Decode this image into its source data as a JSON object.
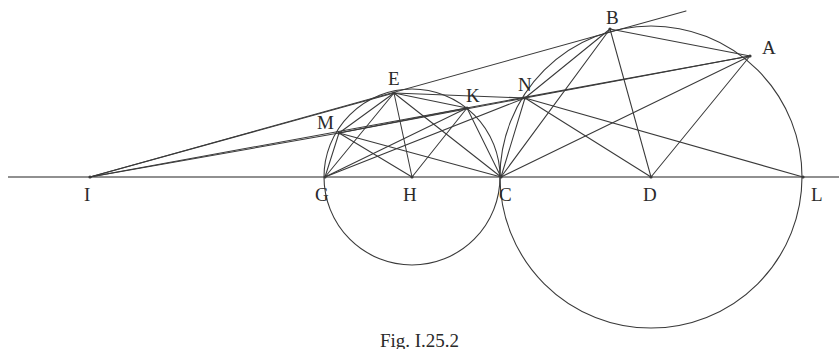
{
  "figure": {
    "caption": "Fig. I.25.2",
    "background_color": "#ffffff",
    "stroke_color": "#3a3a3a",
    "baseline_color": "#6b6b6b",
    "label_color": "#2a2a2a",
    "width": 839,
    "height": 349
  },
  "points": [
    {
      "name": "I",
      "x": 90,
      "y": 177,
      "label": "I",
      "label_dx": -6,
      "label_dy": 8
    },
    {
      "name": "G",
      "x": 325,
      "y": 177,
      "label": "G",
      "label_dx": -10,
      "label_dy": 8
    },
    {
      "name": "H",
      "x": 412,
      "y": 177,
      "label": "H",
      "label_dx": -9,
      "label_dy": 8
    },
    {
      "name": "C",
      "x": 501,
      "y": 177,
      "label": "C",
      "label_dx": -2,
      "label_dy": 8
    },
    {
      "name": "D",
      "x": 651,
      "y": 177,
      "label": "D",
      "label_dx": -8,
      "label_dy": 8
    },
    {
      "name": "L",
      "x": 803,
      "y": 177,
      "label": "L",
      "label_dx": 8,
      "label_dy": 8
    },
    {
      "name": "M",
      "x": 339,
      "y": 133,
      "label": "M",
      "label_dx": -22,
      "label_dy": -20
    },
    {
      "name": "E",
      "x": 394,
      "y": 93,
      "label": "E",
      "label_dx": -6,
      "label_dy": -24
    },
    {
      "name": "K",
      "x": 467,
      "y": 108,
      "label": "K",
      "label_dx": -1,
      "label_dy": -22
    },
    {
      "name": "N",
      "x": 525,
      "y": 98,
      "label": "N",
      "label_dx": -7,
      "label_dy": -23
    },
    {
      "name": "B",
      "x": 610,
      "y": 29,
      "label": "B",
      "label_dx": -4,
      "label_dy": -21
    },
    {
      "name": "A",
      "x": 750,
      "y": 56,
      "label": "A",
      "label_dx": 12,
      "label_dy": -18
    }
  ],
  "circles": [
    {
      "name": "small-circle",
      "cx": 412,
      "cy": 177,
      "r": 88,
      "through": [
        "G",
        "C"
      ]
    },
    {
      "name": "large-circle",
      "cx": 651,
      "cy": 177,
      "r": 151,
      "through": [
        "C",
        "L"
      ]
    }
  ],
  "baseline": {
    "name": "baseline-ILC",
    "x1": 8,
    "y1": 177,
    "x2": 839,
    "y2": 177
  },
  "segments": [
    {
      "name": "segment-I-B-tangent",
      "from": "I",
      "to": "B",
      "extend_to": {
        "x": 686,
        "y": 11
      }
    },
    {
      "name": "segment-I-A",
      "from": "I",
      "to": "A"
    },
    {
      "name": "segment-I-E",
      "from": "I",
      "to": "E"
    },
    {
      "name": "segment-I-M",
      "from": "I",
      "to": "M"
    },
    {
      "name": "segment-M-N",
      "from": "M",
      "to": "N"
    },
    {
      "name": "segment-M-K",
      "from": "M",
      "to": "K"
    },
    {
      "name": "segment-M-E",
      "from": "M",
      "to": "E"
    },
    {
      "name": "segment-M-H",
      "from": "M",
      "to": "H"
    },
    {
      "name": "segment-M-C",
      "from": "M",
      "to": "C"
    },
    {
      "name": "segment-G-E",
      "from": "G",
      "to": "E"
    },
    {
      "name": "segment-G-K",
      "from": "G",
      "to": "K"
    },
    {
      "name": "segment-G-N",
      "from": "G",
      "to": "N"
    },
    {
      "name": "segment-G-M",
      "from": "G",
      "to": "M"
    },
    {
      "name": "segment-E-H",
      "from": "E",
      "to": "H"
    },
    {
      "name": "segment-E-C",
      "from": "E",
      "to": "C"
    },
    {
      "name": "segment-E-K",
      "from": "E",
      "to": "K"
    },
    {
      "name": "segment-E-N",
      "from": "E",
      "to": "N"
    },
    {
      "name": "segment-K-H",
      "from": "K",
      "to": "H"
    },
    {
      "name": "segment-K-C",
      "from": "K",
      "to": "C"
    },
    {
      "name": "segment-N-C",
      "from": "N",
      "to": "C"
    },
    {
      "name": "segment-N-D",
      "from": "N",
      "to": "D"
    },
    {
      "name": "segment-N-A",
      "from": "N",
      "to": "A"
    },
    {
      "name": "segment-N-L",
      "from": "N",
      "to": "L"
    },
    {
      "name": "segment-N-B",
      "from": "N",
      "to": "B"
    },
    {
      "name": "segment-B-C",
      "from": "B",
      "to": "C"
    },
    {
      "name": "segment-B-D",
      "from": "B",
      "to": "D"
    },
    {
      "name": "segment-B-A",
      "from": "B",
      "to": "A"
    },
    {
      "name": "segment-A-C",
      "from": "A",
      "to": "C"
    },
    {
      "name": "segment-A-D",
      "from": "A",
      "to": "D"
    }
  ],
  "chart_data": {
    "type": "diagram",
    "title": "Fig. I.25.2",
    "labels": [
      "I",
      "G",
      "H",
      "C",
      "D",
      "L",
      "M",
      "E",
      "K",
      "N",
      "B",
      "A"
    ]
  }
}
